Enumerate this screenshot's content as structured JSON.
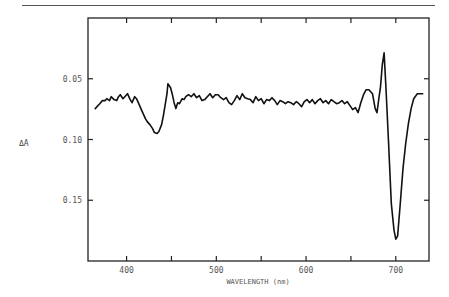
{
  "chart_data": {
    "type": "line",
    "title": "",
    "xlabel": "WAVELENGTH (nm)",
    "ylabel": "ΔA",
    "xlim": [
      357,
      737
    ],
    "ylim": [
      0.2,
      0.0
    ],
    "y_inverted": true,
    "grid": false,
    "legend": null,
    "x_ticks": [
      400,
      450,
      500,
      550,
      600,
      650,
      700
    ],
    "x_tick_labels": [
      "400",
      "",
      "500",
      "",
      "600",
      "",
      "700"
    ],
    "y_ticks": [
      0.05,
      0.1,
      0.15
    ],
    "y_tick_labels": [
      "0.05",
      "0.10",
      "0.15"
    ],
    "series": [
      {
        "name": "ΔA spectrum",
        "color": "#111111",
        "x": [
          365,
          370,
          373,
          376,
          378,
          381,
          383,
          386,
          389,
          391,
          393,
          396,
          398,
          401,
          404,
          406,
          409,
          411,
          414,
          416,
          418,
          421,
          423,
          426,
          429,
          431,
          434,
          436,
          439,
          441,
          443,
          445,
          446,
          449,
          451,
          453,
          455,
          457,
          459,
          462,
          464,
          466,
          469,
          472,
          475,
          478,
          481,
          484,
          487,
          490,
          493,
          496,
          499,
          502,
          505,
          508,
          511,
          514,
          517,
          520,
          523,
          526,
          529,
          532,
          535,
          538,
          541,
          544,
          547,
          550,
          553,
          556,
          559,
          562,
          565,
          568,
          571,
          574,
          577,
          580,
          583,
          586,
          589,
          592,
          595,
          598,
          601,
          604,
          607,
          610,
          613,
          616,
          619,
          622,
          625,
          628,
          631,
          634,
          637,
          640,
          643,
          646,
          649,
          652,
          655,
          658,
          661,
          664,
          667,
          670,
          674,
          677,
          679,
          681,
          683,
          685,
          687,
          689,
          692,
          695,
          698,
          700,
          702,
          705,
          708,
          711,
          714,
          717,
          720,
          724,
          730
        ],
        "y": [
          0.0746,
          0.0705,
          0.068,
          0.068,
          0.0664,
          0.068,
          0.0648,
          0.0672,
          0.068,
          0.0648,
          0.0631,
          0.0664,
          0.0648,
          0.0623,
          0.0672,
          0.0697,
          0.0648,
          0.0664,
          0.0713,
          0.0746,
          0.0779,
          0.0828,
          0.0853,
          0.0877,
          0.091,
          0.0943,
          0.0951,
          0.0934,
          0.0877,
          0.0803,
          0.0713,
          0.0623,
          0.0541,
          0.0574,
          0.0631,
          0.0697,
          0.0746,
          0.0697,
          0.0705,
          0.0664,
          0.0672,
          0.0648,
          0.0631,
          0.0648,
          0.0623,
          0.0656,
          0.0639,
          0.068,
          0.0672,
          0.0648,
          0.0623,
          0.0656,
          0.0631,
          0.0631,
          0.0656,
          0.0672,
          0.0656,
          0.0697,
          0.0713,
          0.068,
          0.0639,
          0.0672,
          0.0623,
          0.0656,
          0.0664,
          0.0672,
          0.0697,
          0.0648,
          0.068,
          0.0664,
          0.0705,
          0.0672,
          0.068,
          0.0656,
          0.068,
          0.0713,
          0.068,
          0.0689,
          0.0705,
          0.0689,
          0.0697,
          0.0713,
          0.0689,
          0.0705,
          0.073,
          0.0689,
          0.0672,
          0.0697,
          0.0672,
          0.0705,
          0.068,
          0.0664,
          0.0697,
          0.068,
          0.0705,
          0.0672,
          0.0689,
          0.0705,
          0.0697,
          0.068,
          0.0705,
          0.0689,
          0.0721,
          0.0754,
          0.0738,
          0.0779,
          0.0697,
          0.0631,
          0.059,
          0.059,
          0.0623,
          0.0746,
          0.0779,
          0.0672,
          0.0566,
          0.0385,
          0.0287,
          0.0566,
          0.1033,
          0.1525,
          0.1746,
          0.182,
          0.1795,
          0.1525,
          0.1238,
          0.1033,
          0.0869,
          0.0746,
          0.0664,
          0.0623,
          0.0623
        ]
      }
    ],
    "annotations": [
      "ΔA"
    ]
  },
  "axes": {
    "x_label": "WAVELENGTH (nm)",
    "y_label": "ΔA",
    "x_tick_labels": [
      "400",
      "500",
      "600",
      "700"
    ],
    "y_tick_labels": [
      "0.05",
      "0.10",
      "0.15"
    ]
  }
}
